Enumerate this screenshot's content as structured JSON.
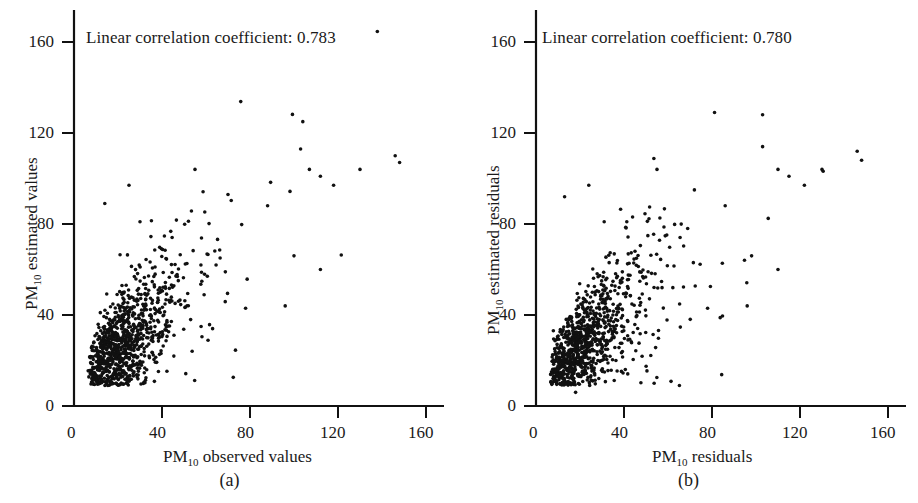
{
  "figure": {
    "background_color": "#ffffff",
    "ink_color": "#111111",
    "point_color": "#111111"
  },
  "panels": [
    {
      "id": "a",
      "caption": "(a)",
      "annotation": "Linear correlation coefficient: 0.783",
      "correlation": 0.783,
      "x_title_prefix": "PM",
      "x_title_sub": "10",
      "x_title_suffix": " observed values",
      "y_title_prefix": "PM",
      "y_title_sub": "10",
      "y_title_suffix": " estimated values",
      "x_ticks": [
        "0",
        "40",
        "80",
        "120",
        "160"
      ],
      "y_ticks": [
        "0",
        "40",
        "80",
        "120",
        "160"
      ]
    },
    {
      "id": "b",
      "caption": "(b)",
      "annotation": "Linear correlation coefficient: 0.780",
      "correlation": 0.78,
      "x_title_prefix": "PM",
      "x_title_sub": "10",
      "x_title_suffix": " residuals",
      "y_title_prefix": "PM",
      "y_title_sub": "10",
      "y_title_suffix": " estimated residuals",
      "x_ticks": [
        "0",
        "40",
        "80",
        "120",
        "160"
      ],
      "y_ticks": [
        "0",
        "40",
        "80",
        "120",
        "160"
      ]
    }
  ],
  "chart_data": [
    {
      "type": "scatter",
      "panel": "a",
      "title": "",
      "annotation": "Linear correlation coefficient: 0.783",
      "correlation_coefficient": 0.783,
      "xlabel": "PM10 observed values",
      "ylabel": "PM10 estimated values",
      "xlim": [
        0,
        175
      ],
      "ylim": [
        0,
        178
      ],
      "xticks": [
        0,
        40,
        80,
        120,
        160
      ],
      "yticks": [
        0,
        40,
        80,
        120,
        160
      ],
      "grid": false,
      "legend": null,
      "n_points": 950,
      "marker": "filled-circle",
      "marker_size_px": 3.2,
      "point_color": "#111111",
      "distribution": {
        "description": "Dense heteroscedastic cloud along a positive diagonal trend; tight cluster near (15,20) widening toward upper right; sparse outliers up to x=150, y=125",
        "x_mode": 22,
        "x_range": [
          6,
          150
        ],
        "y_range": [
          10,
          126
        ],
        "trend_slope": 0.82,
        "trend_intercept": 9
      },
      "notable_points": [
        [
          14,
          89
        ],
        [
          25,
          97
        ],
        [
          30,
          81
        ],
        [
          55,
          104
        ],
        [
          70,
          93
        ],
        [
          88,
          88
        ],
        [
          104,
          125
        ],
        [
          103,
          113
        ],
        [
          107,
          104
        ],
        [
          112,
          101
        ],
        [
          118,
          97
        ],
        [
          130,
          104
        ],
        [
          146,
          110
        ],
        [
          148,
          107
        ],
        [
          100,
          66
        ],
        [
          112,
          60
        ],
        [
          78,
          43
        ],
        [
          96,
          44
        ],
        [
          63,
          34
        ]
      ]
    },
    {
      "type": "scatter",
      "panel": "b",
      "title": "",
      "annotation": "Linear correlation coefficient: 0.780",
      "correlation_coefficient": 0.78,
      "xlabel": "PM10 residuals",
      "ylabel": "PM10 estimated residuals",
      "xlim": [
        0,
        175
      ],
      "ylim": [
        0,
        178
      ],
      "xticks": [
        0,
        40,
        80,
        120,
        160
      ],
      "yticks": [
        0,
        40,
        80,
        120,
        160
      ],
      "grid": false,
      "legend": null,
      "n_points": 950,
      "marker": "filled-circle",
      "marker_size_px": 3.2,
      "point_color": "#111111",
      "distribution": {
        "description": "Nearly identical heteroscedastic cloud to panel (a); tight cluster near (15,20) fanning out to the upper right; one low outlier near (18,6)",
        "x_mode": 22,
        "x_range": [
          6,
          150
        ],
        "y_range": [
          6,
          128
        ],
        "trend_slope": 0.82,
        "trend_intercept": 9
      },
      "notable_points": [
        [
          13,
          92
        ],
        [
          24,
          97
        ],
        [
          31,
          81
        ],
        [
          55,
          104
        ],
        [
          72,
          95
        ],
        [
          86,
          88
        ],
        [
          103,
          128
        ],
        [
          103,
          114
        ],
        [
          110,
          104
        ],
        [
          115,
          101
        ],
        [
          122,
          97
        ],
        [
          130,
          104
        ],
        [
          146,
          112
        ],
        [
          148,
          108
        ],
        [
          98,
          66
        ],
        [
          110,
          60
        ],
        [
          78,
          43
        ],
        [
          96,
          44
        ],
        [
          18,
          6
        ]
      ]
    }
  ]
}
